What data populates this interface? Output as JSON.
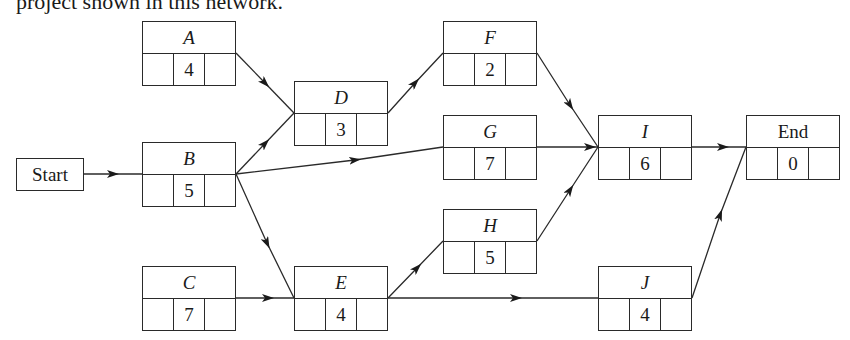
{
  "caption": "project shown in this network.",
  "start": {
    "label": "Start"
  },
  "nodes": {
    "A": {
      "label": "A",
      "duration": "4"
    },
    "B": {
      "label": "B",
      "duration": "5"
    },
    "C": {
      "label": "C",
      "duration": "7"
    },
    "D": {
      "label": "D",
      "duration": "3"
    },
    "E": {
      "label": "E",
      "duration": "4"
    },
    "F": {
      "label": "F",
      "duration": "2"
    },
    "G": {
      "label": "G",
      "duration": "7"
    },
    "H": {
      "label": "H",
      "duration": "5"
    },
    "I": {
      "label": "I",
      "duration": "6"
    },
    "J": {
      "label": "J",
      "duration": "4"
    },
    "End": {
      "label": "End",
      "duration": "0"
    }
  },
  "edges": [
    [
      "Start",
      "B"
    ],
    [
      "A",
      "D"
    ],
    [
      "B",
      "D"
    ],
    [
      "B",
      "G"
    ],
    [
      "B",
      "E"
    ],
    [
      "C",
      "E"
    ],
    [
      "D",
      "F"
    ],
    [
      "E",
      "H"
    ],
    [
      "E",
      "J"
    ],
    [
      "F",
      "I"
    ],
    [
      "G",
      "I"
    ],
    [
      "H",
      "I"
    ],
    [
      "I",
      "End"
    ],
    [
      "J",
      "End"
    ]
  ],
  "colors": {
    "line": "#2a2a2a",
    "background": "#ffffff"
  }
}
